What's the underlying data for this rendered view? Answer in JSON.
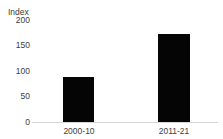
{
  "chart_data": {
    "type": "bar",
    "title": "",
    "xlabel": "",
    "ylabel": "Index",
    "categories": [
      "2000-10",
      "2011-21"
    ],
    "values": [
      88,
      172
    ],
    "ylim": [
      0,
      200
    ],
    "yticks": [
      200,
      150,
      100,
      50,
      0
    ],
    "ytick_labels": [
      "200",
      "150",
      "100",
      "50",
      "0"
    ],
    "grid": false,
    "legend": null,
    "bar_color": "#050505",
    "axis_color": "#d6d6d6",
    "text_color": "#3d3d3d"
  },
  "axis": {
    "unit_label": "Index"
  },
  "title_fragment": {
    "text": ""
  }
}
